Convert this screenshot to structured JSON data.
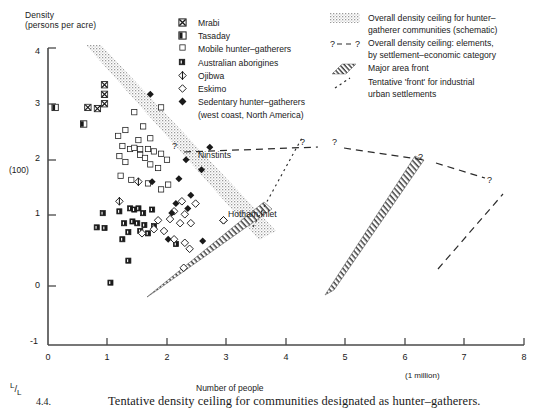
{
  "figure": {
    "caption_number": "4.4.",
    "caption_text": "Tentative density ceiling for communities designated as hunter–gatherers."
  },
  "axes": {
    "y_title": "Density\n(persons per acre)",
    "y_note": "(100)",
    "y_ticks": [
      "4",
      "3",
      "2",
      "1",
      "0",
      "-1"
    ],
    "x_title": "Number of people",
    "x_note": "(1 million)",
    "x_ticks": [
      "0",
      "1",
      "2",
      "3",
      "4",
      "5",
      "6",
      "7",
      "8"
    ],
    "origin_note": "L/L"
  },
  "legend_markers": {
    "items": [
      {
        "glyph": "square-crossed",
        "label": "Mrabi"
      },
      {
        "glyph": "square-half",
        "label": "Tasaday"
      },
      {
        "glyph": "square-open",
        "label": "Mobile hunter–gatherers"
      },
      {
        "glyph": "square-filled-small",
        "label": "Australian aborigines"
      },
      {
        "glyph": "diamond-lined",
        "label": "Ojibwa"
      },
      {
        "glyph": "diamond-open",
        "label": "Eskimo"
      },
      {
        "glyph": "diamond-filled",
        "label": "Sedentary hunter–gatherers"
      }
    ],
    "sub_label": "(west coast, North America)"
  },
  "legend_bands": {
    "items": [
      {
        "glyph": "stipple-band",
        "line1": "Overall density ceiling for hunter–",
        "line2": "gatherer communities (schematic)"
      },
      {
        "glyph": "dashed-question",
        "line1": "Overall density ceiling: elements,",
        "line2": "by settlement–economic category"
      },
      {
        "glyph": "hatched-band",
        "line1": "Major area front",
        "line2": ""
      },
      {
        "glyph": "dash-dot-line",
        "line1": "Tentative 'front' for industrial",
        "line2": "urban settlements"
      }
    ]
  },
  "annotations": {
    "ninstints": "Ninstints",
    "hotham_inlet": "Hotham Inlet",
    "question_marks": [
      "?",
      "?",
      "?",
      "?",
      "?"
    ]
  },
  "colors": {
    "ink": "#1a1a1a",
    "axis": "#4a4a4a",
    "stipple": "#b9b9b9",
    "hatch": "#5a5a5a",
    "dash": "#2b2b2b"
  },
  "chart_data": {
    "type": "scatter",
    "title": "Tentative density ceiling for communities designated as hunter–gatherers.",
    "xlabel": "Number of people",
    "ylabel": "Density (persons per acre)",
    "xlim": [
      0,
      8
    ],
    "ylim": [
      -1,
      4
    ],
    "x_note": "(1 million)",
    "y_note": "(100)",
    "grid": false,
    "legend_position": "top",
    "series": [
      {
        "name": "Mrabi",
        "glyph": "square-crossed",
        "points": [
          [
            0.95,
            3.38
          ],
          [
            0.95,
            3.22
          ],
          [
            0.95,
            3.06
          ],
          [
            0.83,
            2.98
          ],
          [
            0.67,
            3.0
          ]
        ]
      },
      {
        "name": "Tasaday",
        "glyph": "square-half",
        "points": [
          [
            0.12,
            3.0
          ],
          [
            0.6,
            2.72
          ]
        ]
      },
      {
        "name": "Mobile hunter–gatherers",
        "glyph": "square-open",
        "points": [
          [
            1.9,
            3.0
          ],
          [
            1.45,
            2.92
          ],
          [
            1.3,
            2.62
          ],
          [
            1.18,
            2.52
          ],
          [
            1.6,
            2.68
          ],
          [
            1.52,
            2.45
          ],
          [
            1.72,
            2.48
          ],
          [
            1.25,
            2.35
          ],
          [
            1.38,
            2.3
          ],
          [
            1.45,
            2.32
          ],
          [
            1.55,
            2.3
          ],
          [
            1.68,
            2.3
          ],
          [
            1.78,
            2.26
          ],
          [
            1.2,
            2.18
          ],
          [
            1.3,
            2.08
          ],
          [
            1.55,
            2.2
          ],
          [
            1.63,
            2.15
          ],
          [
            1.9,
            2.22
          ],
          [
            1.72,
            2.04
          ],
          [
            1.85,
            1.98
          ],
          [
            2.0,
            2.12
          ],
          [
            1.22,
            1.85
          ],
          [
            1.4,
            1.78
          ],
          [
            1.68,
            1.72
          ],
          [
            1.9,
            1.62
          ],
          [
            2.02,
            1.7
          ]
        ]
      },
      {
        "name": "Australian aborigines",
        "glyph": "square-filled-small",
        "points": [
          [
            0.92,
            1.22
          ],
          [
            1.2,
            1.25
          ],
          [
            1.38,
            1.3
          ],
          [
            1.45,
            1.28
          ],
          [
            1.52,
            1.3
          ],
          [
            1.6,
            1.22
          ],
          [
            1.75,
            1.28
          ],
          [
            1.28,
            1.05
          ],
          [
            1.42,
            1.08
          ],
          [
            1.5,
            1.05
          ],
          [
            1.62,
            1.02
          ],
          [
            1.78,
            1.0
          ],
          [
            0.82,
            0.98
          ],
          [
            0.95,
            0.97
          ],
          [
            1.35,
            0.9
          ],
          [
            1.55,
            0.92
          ],
          [
            1.68,
            0.88
          ],
          [
            1.25,
            0.78
          ],
          [
            2.15,
            0.7
          ],
          [
            1.35,
            0.42
          ],
          [
            1.05,
            0.05
          ]
        ]
      },
      {
        "name": "Ojibwa",
        "glyph": "diamond-lined",
        "points": [
          [
            1.52,
            1.75
          ],
          [
            1.2,
            1.42
          ]
        ]
      },
      {
        "name": "Eskimo",
        "glyph": "diamond-open",
        "points": [
          [
            2.25,
            1.42
          ],
          [
            2.48,
            1.38
          ],
          [
            2.12,
            1.25
          ],
          [
            2.3,
            1.2
          ],
          [
            1.85,
            1.1
          ],
          [
            2.05,
            1.12
          ],
          [
            2.22,
            1.05
          ],
          [
            2.4,
            1.05
          ],
          [
            1.78,
            0.95
          ],
          [
            1.95,
            0.92
          ],
          [
            1.58,
            0.88
          ],
          [
            2.12,
            0.78
          ],
          [
            2.3,
            0.72
          ],
          [
            2.38,
            0.62
          ],
          [
            2.28,
            0.3
          ],
          [
            2.95,
            1.1
          ]
        ]
      },
      {
        "name": "Sedentary hunter–gatherers (west coast, North America)",
        "glyph": "diamond-filled",
        "points": [
          [
            1.72,
            3.22
          ],
          [
            2.32,
            2.12
          ],
          [
            2.58,
            1.95
          ],
          [
            2.2,
            1.8
          ],
          [
            1.75,
            1.75
          ],
          [
            2.4,
            1.52
          ],
          [
            2.15,
            1.38
          ],
          [
            2.35,
            1.3
          ],
          [
            2.08,
            1.22
          ],
          [
            2.02,
            0.78
          ],
          [
            2.6,
            0.75
          ]
        ]
      }
    ],
    "annotated_points": [
      {
        "label": "Ninstints",
        "glyph": "diamond-filled",
        "x": 2.72,
        "y": 2.33
      },
      {
        "label": "Hotham Inlet",
        "glyph": "diamond-open",
        "x": 2.95,
        "y": 1.1
      }
    ],
    "bands": [
      {
        "name": "Overall density ceiling for hunter–gatherer communities (schematic)",
        "style": "stipple",
        "from": [
          0.75,
          4.0
        ],
        "to": [
          3.05,
          0.78
        ]
      },
      {
        "name": "Major area front (left)",
        "style": "hatched",
        "from": [
          1.68,
          -0.05
        ],
        "to": [
          2.95,
          1.05
        ]
      },
      {
        "name": "Major area front (right)",
        "style": "hatched",
        "from": [
          4.65,
          0.02
        ],
        "to": [
          6.2,
          1.78
        ]
      }
    ],
    "dashed_lines": [
      {
        "name": "Overall density ceiling: elements, by settlement–economic category",
        "style": "dashed",
        "points": [
          [
            2.88,
            2.38
          ],
          [
            4.6,
            2.35
          ]
        ],
        "end_markers": [
          "?",
          "?"
        ]
      },
      {
        "name": "Overall density ceiling: elements, by settlement–economic category",
        "style": "dashed",
        "points": [
          [
            4.98,
            2.38
          ],
          [
            6.2,
            1.78
          ]
        ],
        "end_markers": [
          "?"
        ]
      },
      {
        "name": "Overall density ceiling: elements, by settlement–economic category",
        "style": "dashed",
        "points": [
          [
            6.3,
            1.78
          ],
          [
            7.0,
            1.6
          ]
        ],
        "end_markers": [
          "?"
        ]
      },
      {
        "name": "Tentative 'front' for industrial urban settlements",
        "style": "dash-dot",
        "points": [
          [
            3.45,
            0.98
          ],
          [
            4.25,
            2.0
          ]
        ]
      },
      {
        "name": "Tentative 'front' for industrial urban settlements",
        "style": "dash-dot",
        "points": [
          [
            6.55,
            0.3
          ],
          [
            7.55,
            1.4
          ]
        ]
      }
    ]
  }
}
